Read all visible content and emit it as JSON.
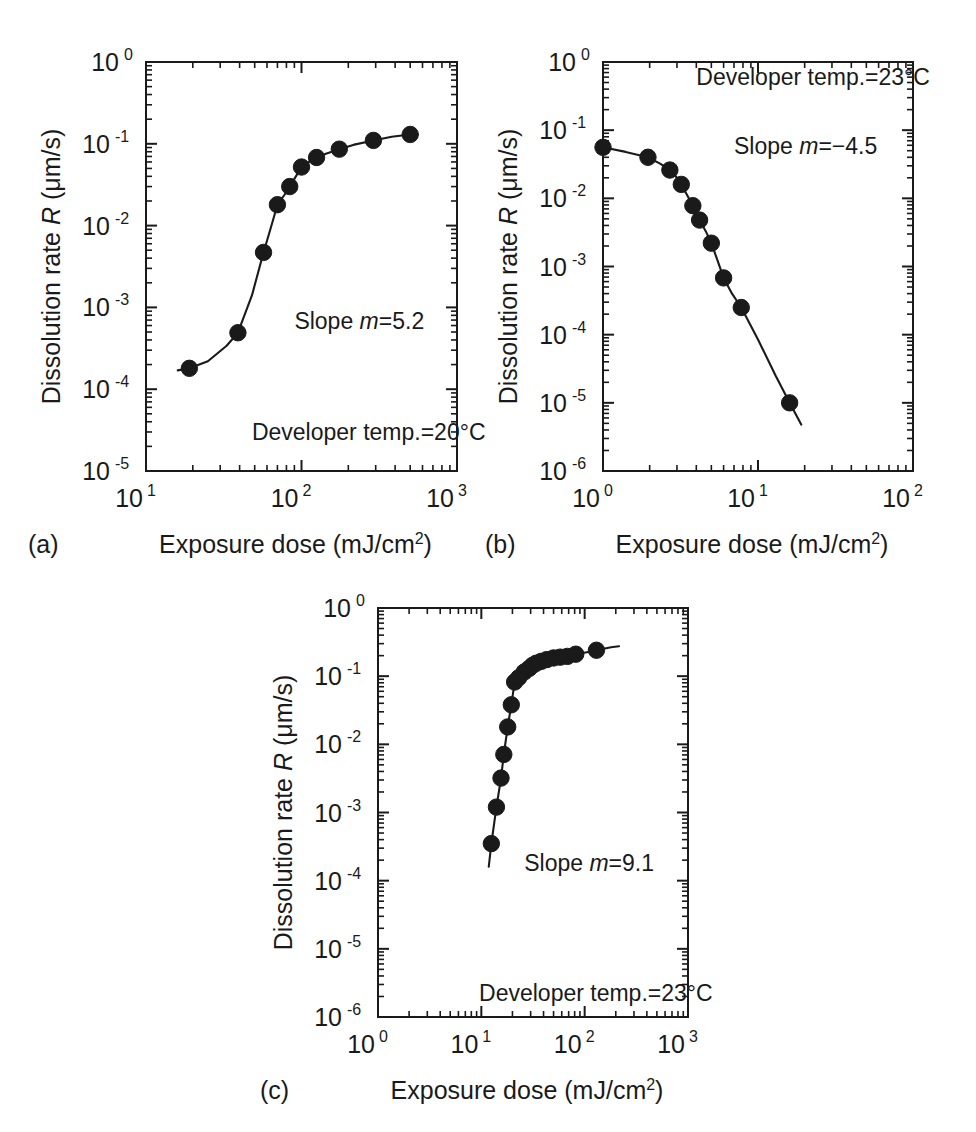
{
  "figure": {
    "background": "#ffffff",
    "ink_color": "#1a1a1a",
    "axis_title_x": "Exposure dose (mJ/cm",
    "axis_title_x_exp": "2",
    "axis_title_x_tail": ")",
    "axis_title_y_pre": "Dissolution rate ",
    "axis_title_y_sym": "R",
    "axis_title_y_post": " (μm/s)"
  },
  "panels": [
    {
      "id": "a",
      "letter": "(a)",
      "annotation_slope_pre": "Slope ",
      "annotation_slope_sym": "m",
      "annotation_slope_val": "=5.2",
      "annotation_temp": "Developer temp.=20°C",
      "x_tick_labels": [
        "10",
        "10",
        "10"
      ],
      "x_tick_exps": [
        "1",
        "2",
        "3"
      ],
      "y_tick_labels": [
        "10",
        "10",
        "10",
        "10",
        "10",
        "10"
      ],
      "y_tick_exps": [
        "0",
        "-1",
        "-2",
        "-3",
        "-4",
        "-5"
      ]
    },
    {
      "id": "b",
      "letter": "(b)",
      "annotation_slope_pre": "Slope ",
      "annotation_slope_sym": "m",
      "annotation_slope_val": "=−4.5",
      "annotation_temp": "Developer temp.=23°C",
      "x_tick_labels": [
        "10",
        "10",
        "10"
      ],
      "x_tick_exps": [
        "0",
        "1",
        "2"
      ],
      "y_tick_labels": [
        "10",
        "10",
        "10",
        "10",
        "10",
        "10",
        "10"
      ],
      "y_tick_exps": [
        "0",
        "-1",
        "-2",
        "-3",
        "-4",
        "-5",
        "-6"
      ]
    },
    {
      "id": "c",
      "letter": "(c)",
      "annotation_slope_pre": "Slope ",
      "annotation_slope_sym": "m",
      "annotation_slope_val": "=9.1",
      "annotation_temp": "Developer temp.=23°C",
      "x_tick_labels": [
        "10",
        "10",
        "10",
        "10"
      ],
      "x_tick_exps": [
        "0",
        "1",
        "2",
        "3"
      ],
      "y_tick_labels": [
        "10",
        "10",
        "10",
        "10",
        "10",
        "10",
        "10"
      ],
      "y_tick_exps": [
        "0",
        "-1",
        "-2",
        "-3",
        "-4",
        "-5",
        "-6"
      ]
    }
  ],
  "chart_data": [
    {
      "panel": "a",
      "type": "scatter",
      "title": "",
      "xlabel": "Exposure dose (mJ/cm2)",
      "ylabel": "Dissolution rate R (μm/s)",
      "xscale": "log",
      "yscale": "log",
      "xlim": [
        10,
        1000
      ],
      "ylim": [
        1e-05,
        1
      ],
      "grid": false,
      "legend": "none",
      "annotations": [
        "Slope m=5.2",
        "Developer temp.=20°C"
      ],
      "slope_m": 5.2,
      "developer_temp_C": 20,
      "x": [
        19,
        39,
        57,
        70,
        84,
        100,
        125,
        175,
        290,
        500
      ],
      "y": [
        0.00018,
        0.00049,
        0.0047,
        0.018,
        0.03,
        0.052,
        0.068,
        0.086,
        0.11,
        0.13
      ],
      "fit_curve": {
        "x": [
          16,
          19,
          25,
          33,
          39,
          48,
          57,
          65,
          70,
          78,
          84,
          92,
          100,
          112,
          125,
          145,
          175,
          215,
          290,
          380,
          500,
          560
        ],
        "y": [
          0.00017,
          0.00018,
          0.00022,
          0.00034,
          0.00049,
          0.0014,
          0.0047,
          0.011,
          0.018,
          0.024,
          0.03,
          0.04,
          0.052,
          0.06,
          0.068,
          0.076,
          0.086,
          0.097,
          0.11,
          0.122,
          0.13,
          0.131
        ]
      }
    },
    {
      "panel": "b",
      "type": "scatter",
      "title": "",
      "xlabel": "Exposure dose (mJ/cm2)",
      "ylabel": "Dissolution rate R (μm/s)",
      "xscale": "log",
      "yscale": "log",
      "xlim": [
        1,
        100
      ],
      "ylim": [
        1e-06,
        1
      ],
      "grid": false,
      "legend": "none",
      "annotations": [
        "Developer temp.=23°C",
        "Slope m=−4.5"
      ],
      "slope_m": -4.5,
      "developer_temp_C": 23,
      "x": [
        1.0,
        1.95,
        2.7,
        3.2,
        3.8,
        4.2,
        5.0,
        6.0,
        7.8,
        16.0
      ],
      "y": [
        0.056,
        0.04,
        0.026,
        0.016,
        0.0078,
        0.0048,
        0.0022,
        0.00068,
        0.00025,
        1e-05
      ],
      "fit_curve": {
        "x": [
          1.0,
          1.4,
          1.95,
          2.35,
          2.7,
          3.0,
          3.2,
          3.5,
          3.8,
          4.0,
          4.2,
          4.6,
          5.0,
          5.5,
          6.0,
          6.8,
          7.8,
          10.0,
          13.0,
          16.0,
          19.0
        ],
        "y": [
          0.056,
          0.048,
          0.04,
          0.032,
          0.026,
          0.02,
          0.016,
          0.011,
          0.0078,
          0.006,
          0.0048,
          0.0033,
          0.0022,
          0.0012,
          0.00068,
          0.0004,
          0.00025,
          8.5e-05,
          2.5e-05,
          1e-05,
          4.8e-06
        ]
      }
    },
    {
      "panel": "c",
      "type": "scatter",
      "title": "",
      "xlabel": "Exposure dose (mJ/cm2)",
      "ylabel": "Dissolution rate R (μm/s)",
      "xscale": "log",
      "yscale": "log",
      "xlim": [
        1,
        1000
      ],
      "ylim": [
        1e-06,
        1
      ],
      "grid": false,
      "legend": "none",
      "annotations": [
        "Slope m=9.1",
        "Developer temp.=23°C"
      ],
      "slope_m": 9.1,
      "developer_temp_C": 23,
      "x": [
        12.5,
        14.0,
        15.5,
        16.5,
        18.0,
        19.5,
        21.0,
        23.0,
        26.0,
        29.0,
        31.5,
        34.0,
        38.0,
        43.0,
        50.0,
        58.0,
        68.0,
        82.0,
        130.0
      ],
      "y": [
        0.00035,
        0.0012,
        0.0032,
        0.0071,
        0.018,
        0.038,
        0.082,
        0.095,
        0.115,
        0.13,
        0.145,
        0.155,
        0.165,
        0.175,
        0.185,
        0.19,
        0.195,
        0.21,
        0.24
      ],
      "fit_curve": {
        "x": [
          11.8,
          12.5,
          14.0,
          15.5,
          16.5,
          18.0,
          19.5,
          21.0,
          23.0,
          26.0,
          29.0,
          31.5,
          34.0,
          38.0,
          43.0,
          50.0,
          58.0,
          68.0,
          82.0,
          105.0,
          130.0,
          180.0,
          215.0
        ],
        "y": [
          0.00016,
          0.00035,
          0.0012,
          0.0032,
          0.0071,
          0.018,
          0.038,
          0.082,
          0.095,
          0.115,
          0.13,
          0.145,
          0.155,
          0.165,
          0.175,
          0.185,
          0.19,
          0.195,
          0.21,
          0.225,
          0.24,
          0.265,
          0.275
        ]
      }
    }
  ]
}
